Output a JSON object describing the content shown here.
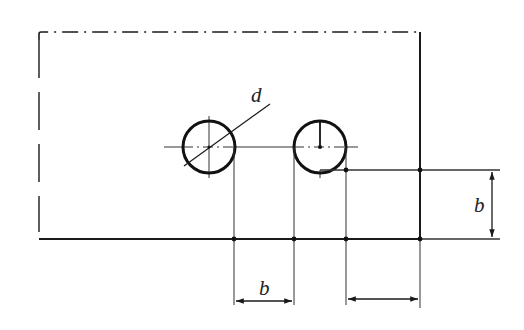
{
  "diagram": {
    "type": "technical-drawing",
    "colors": {
      "line": "#1a1a1a",
      "thin_line": "#333333",
      "background": "#ffffff"
    },
    "plate": {
      "outline": {
        "left": 39,
        "top": 32,
        "right": 420,
        "bottom": 239
      },
      "break_lines": [
        "top",
        "left"
      ]
    },
    "holes": [
      {
        "id": "hole-1",
        "cx": 209,
        "cy": 147,
        "r": 26
      },
      {
        "id": "hole-2",
        "cx": 320,
        "cy": 147,
        "r": 26
      }
    ],
    "labels": {
      "diameter": "d",
      "spacing_bottom": "b",
      "offset_right": "b"
    },
    "dimensions": {
      "bottom_left": {
        "x1": 234,
        "x2": 294,
        "y": 300,
        "label": "b"
      },
      "bottom_right": {
        "x1": 346,
        "x2": 420,
        "y": 300,
        "label": ""
      },
      "right_vertical": {
        "x": 492,
        "y1": 170,
        "y2": 239,
        "label": "b"
      }
    }
  }
}
